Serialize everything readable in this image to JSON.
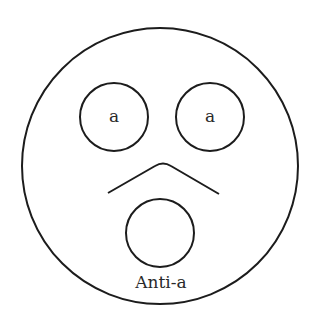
{
  "diagram": {
    "type": "face-diagram",
    "colors": {
      "stroke": "#1c1c1c",
      "text": "#2a2a2a",
      "background": "#ffffff"
    },
    "face": {
      "cx": 160,
      "cy": 166,
      "r": 138
    },
    "eyes": [
      {
        "label": "a",
        "cx": 114,
        "cy": 117,
        "r": 34
      },
      {
        "label": "a",
        "cx": 210,
        "cy": 117,
        "r": 34
      }
    ],
    "nose": {
      "points": "108,193 160,165 166,165 219,194"
    },
    "mouth": {
      "cx": 160,
      "cy": 233,
      "r": 34
    },
    "caption": {
      "text": "Anti-a",
      "x": 161,
      "y": 288
    }
  }
}
